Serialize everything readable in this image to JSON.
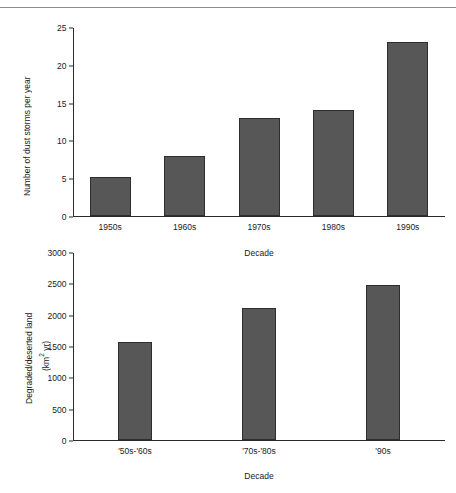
{
  "page": {
    "cropped_header_text": "",
    "divider": "horizontal-rule"
  },
  "chart_data": [
    {
      "id": "dust-storms",
      "type": "bar",
      "title": "",
      "xlabel": "Decade",
      "ylabel": "Number of dust storms per year",
      "categories": [
        "1950s",
        "1960s",
        "1970s",
        "1980s",
        "1990s"
      ],
      "values": [
        5.2,
        8,
        13,
        14,
        23
      ],
      "ylim": [
        0,
        25
      ],
      "yticks": [
        0,
        5,
        10,
        15,
        20,
        25
      ],
      "grid": false,
      "legend": "none",
      "bar_color": "#575757"
    },
    {
      "id": "degraded-land",
      "type": "bar",
      "title": "",
      "xlabel": "Decade",
      "ylabel_line1": "Degraded/deserted land",
      "ylabel_line2": "(km2 yr)",
      "ylabel_unit_base": "(km",
      "ylabel_unit_sup": "2",
      "ylabel_unit_tail": " yr)",
      "categories": [
        "'50s-'60s",
        "'70s-'80s",
        "'90s"
      ],
      "values": [
        1570,
        2110,
        2480
      ],
      "ylim": [
        0,
        3000
      ],
      "yticks": [
        0,
        500,
        1000,
        1500,
        2000,
        2500,
        3000
      ],
      "grid": false,
      "legend": "none",
      "bar_color": "#575757"
    }
  ]
}
